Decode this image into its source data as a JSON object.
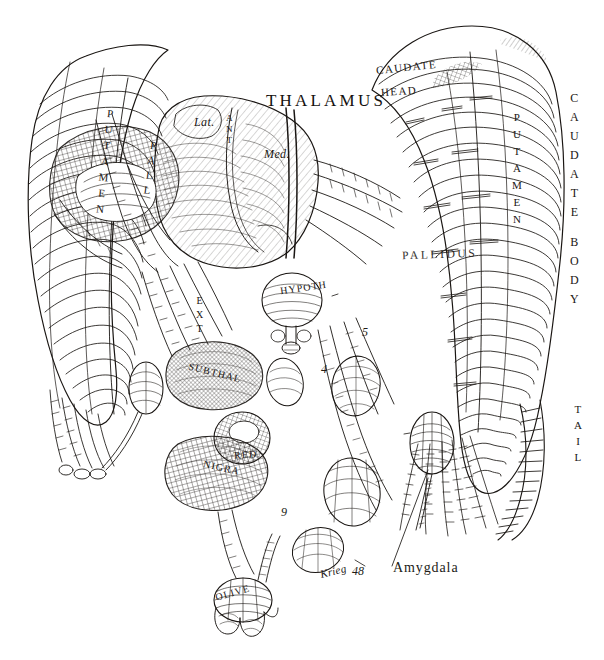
{
  "figure": {
    "kind": "anatomical-line-engraving",
    "background_color": "#ffffff",
    "ink_color": "#1a1613",
    "signature": "Krieg",
    "signature_number": "48"
  },
  "labels": {
    "thalamus": "THALAMUS",
    "thalamus_lat": "Lat.",
    "thalamus_med": "Med.",
    "thalamus_ant": "ANT",
    "caudate_head_top": "CAUDATE",
    "caudate_head_bottom": "HEAD",
    "caudate_body": "CAUDATE BODY",
    "caudate_tail": "TAIL",
    "putamen_right": "PUTAMEN",
    "putamen_left": "PUTAMEN",
    "pallidus_right": "PALLIDUS",
    "pallidus_left": "PALL",
    "pallidus_ext": "EXT",
    "hypothalamus": "HYPOTH",
    "subthalamus": "SUBTHAL",
    "red_nucleus": "RED",
    "substantia_nigra": "NIGRA",
    "olive": "OLIVE",
    "amygdala": "Amygdala"
  },
  "callouts": [
    {
      "id": "c4",
      "text": "4"
    },
    {
      "id": "c5",
      "text": "5"
    },
    {
      "id": "c8",
      "text": "8"
    },
    {
      "id": "c9",
      "text": "9"
    }
  ],
  "colors": {
    "ink": "#1a1613",
    "ink_light": "#4a4038",
    "paper": "#ffffff"
  }
}
